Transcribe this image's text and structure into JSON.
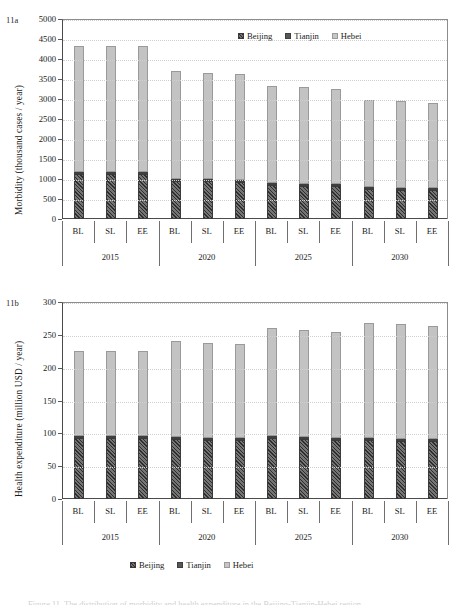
{
  "figure": {
    "caption": "Figure 11. The distribution of morbidity and health expenditure in the Beijing-Tianjin-Hebei region.",
    "panel_a_tag": "11a",
    "panel_b_tag": "11b"
  },
  "legend": {
    "items": [
      {
        "label": "Beijing",
        "swatch": "dark-hatched-swatch",
        "color": "#4d4d4d"
      },
      {
        "label": "Tianjin",
        "swatch": "dark-solid-swatch",
        "color": "#575757"
      },
      {
        "label": "Hebei",
        "swatch": "light-gray-swatch",
        "color": "#c6c6c6"
      }
    ]
  },
  "chart_data": [
    {
      "id": "11a",
      "type": "bar",
      "stacked": true,
      "title": "",
      "panel_label": "11a",
      "xlabel": "",
      "ylabel": "Morbidity (thousand cases / year)",
      "ylim": [
        0,
        5000
      ],
      "ytick_step": 500,
      "yticks": [
        0,
        500,
        1000,
        1500,
        2000,
        2500,
        3000,
        3500,
        4000,
        4500,
        5000
      ],
      "grid": true,
      "legend_position": "top-right-inside",
      "groups": [
        "2015",
        "2020",
        "2025",
        "2030"
      ],
      "categories": [
        "BL",
        "SL",
        "EE"
      ],
      "x": [
        "BL",
        "SL",
        "EE",
        "BL",
        "SL",
        "EE",
        "BL",
        "SL",
        "EE",
        "BL",
        "SL",
        "EE"
      ],
      "series": [
        {
          "name": "Beijing",
          "values": [
            1140,
            1135,
            1130,
            960,
            950,
            935,
            855,
            845,
            830,
            755,
            745,
            740
          ]
        },
        {
          "name": "Tianjin",
          "values": [
            8,
            8,
            8,
            7,
            7,
            7,
            6,
            6,
            6,
            6,
            6,
            6
          ]
        },
        {
          "name": "Hebei",
          "values": [
            3182,
            3187,
            3187,
            2733,
            2703,
            2683,
            2464,
            2439,
            2404,
            2204,
            2194,
            2149
          ]
        }
      ],
      "totals": [
        4330,
        4330,
        4325,
        3700,
        3660,
        3625,
        3325,
        3290,
        3240,
        2965,
        2945,
        2895
      ]
    },
    {
      "id": "11b",
      "type": "bar",
      "stacked": true,
      "title": "",
      "panel_label": "11b",
      "xlabel": "",
      "ylabel": "Health expenditure (million USD / year)",
      "ylim": [
        0,
        300
      ],
      "ytick_step": 50,
      "yticks": [
        0,
        50,
        100,
        150,
        200,
        250,
        300
      ],
      "grid": true,
      "legend_position": "bottom-center-outside",
      "groups": [
        "2015",
        "2020",
        "2025",
        "2030"
      ],
      "categories": [
        "BL",
        "SL",
        "EE"
      ],
      "x": [
        "BL",
        "SL",
        "EE",
        "BL",
        "SL",
        "EE",
        "BL",
        "SL",
        "EE",
        "BL",
        "SL",
        "EE"
      ],
      "series": [
        {
          "name": "Beijing",
          "values": [
            94.5,
            94.5,
            94.5,
            92.0,
            91.0,
            90.0,
            93.0,
            91.5,
            90.5,
            90.5,
            89.0,
            88.5
          ]
        },
        {
          "name": "Tianjin",
          "values": [
            1.0,
            1.0,
            1.0,
            1.0,
            1.0,
            1.0,
            1.0,
            1.0,
            1.0,
            1.0,
            1.0,
            1.0
          ]
        },
        {
          "name": "Hebei",
          "values": [
            130.5,
            130.5,
            130.5,
            147.0,
            146.0,
            145.0,
            166.0,
            164.5,
            162.5,
            176.5,
            176.0,
            173.5
          ]
        }
      ],
      "totals": [
        226,
        226,
        226,
        240,
        238,
        236,
        260,
        257,
        254,
        268,
        266,
        263
      ]
    }
  ]
}
